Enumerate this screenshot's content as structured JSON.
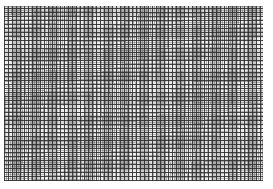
{
  "image": {
    "subject": "fine square grid mesh texture",
    "grid_spacing_px": 4,
    "line_color": "#282828",
    "background_color": "#ffffff",
    "mesh_fill_color": "#d8d8d8"
  },
  "caption": {
    "text": ""
  }
}
